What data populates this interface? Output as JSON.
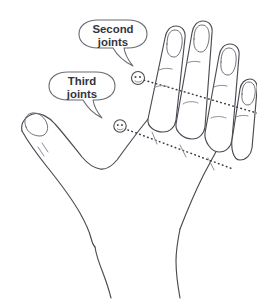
{
  "figure": {
    "background_color": "#ffffff",
    "line_color": "#4a4a52",
    "text_color": "#34343c"
  },
  "callouts": [
    {
      "id": "second-joints",
      "line1": "Second",
      "line2": "joints",
      "points_to": "second-joint-marker",
      "tail_direction": "down-right"
    },
    {
      "id": "third-joints",
      "line1": "Third",
      "line2": "joints",
      "points_to": "third-joint-marker",
      "tail_direction": "down-right"
    }
  ],
  "markers": [
    {
      "id": "second-joint-marker",
      "label": "second joint indicator"
    },
    {
      "id": "third-joint-marker",
      "label": "third joint indicator"
    }
  ],
  "guide_lines": [
    {
      "id": "second-joints-line",
      "style": "dotted",
      "label": "second joints alignment"
    },
    {
      "id": "third-joints-line",
      "style": "dotted",
      "label": "third joints alignment"
    }
  ],
  "anatomy": {
    "fingers": [
      "index",
      "middle",
      "ring",
      "little"
    ],
    "thumb": "thumb",
    "palm": "back of hand",
    "wrist": "wrist"
  }
}
